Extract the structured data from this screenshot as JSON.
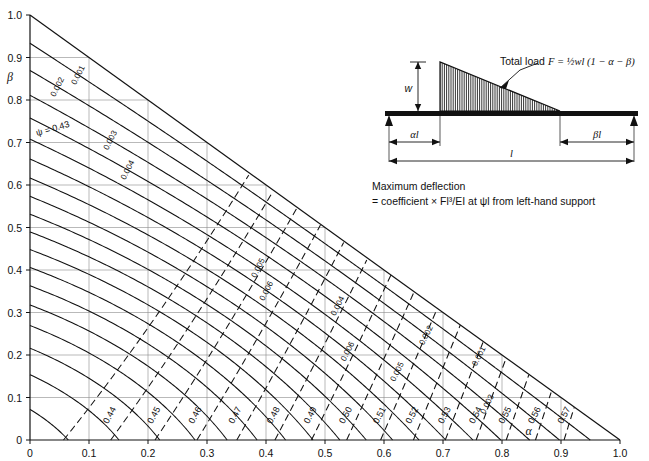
{
  "figure": {
    "axes": {
      "xlabel": "α",
      "ylabel": "β",
      "xticks": [
        "0",
        "0.1",
        "0.2",
        "0.3",
        "0.4",
        "0.5",
        "0.6",
        "0.7",
        "0.8",
        "0.9",
        "1.0"
      ],
      "yticks": [
        "0",
        "0.1",
        "0.2",
        "0.3",
        "0.4",
        "0.5",
        "0.6",
        "0.7",
        "0.8",
        "0.9",
        "1.0"
      ],
      "xlim": [
        0,
        1
      ],
      "ylim": [
        0,
        1
      ]
    },
    "diagram": {
      "total_load_label": "Total load",
      "total_load_formula": "F = ½wl (1 − α − β)",
      "load_height_label": "w",
      "left_span_label": "αl",
      "right_span_label": "βl",
      "total_span_label": "l"
    },
    "caption": {
      "line1": "Maximum deflection",
      "line2": "= coefficient × Fl³/EI at ψl from left-hand support"
    },
    "psi_first_label": "ψ = 0.43"
  },
  "chart_data": {
    "type": "contour",
    "title": "",
    "xlabel": "α",
    "ylabel": "β",
    "xlim": [
      0,
      1
    ],
    "ylim": [
      0,
      1
    ],
    "grid": true,
    "domain": "triangular region alpha + beta <= 1",
    "series": [
      {
        "name": "deflection coefficient",
        "style": "solid",
        "levels": [
          0.001,
          0.002,
          0.003,
          0.004,
          0.005,
          0.006,
          0.007,
          0.008,
          0.009,
          0.01,
          0.011,
          0.012,
          0.013,
          0.014,
          0.015,
          0.016,
          0.017,
          0.018,
          0.019,
          0.02,
          0.021
        ],
        "labels": [
          "0.001",
          "0.002",
          "0.003",
          "0.004",
          "0.005",
          "0.006",
          "0.007",
          "0.008",
          "0.009",
          "0.010",
          "0.011",
          "0.012",
          "0.013",
          "0.014",
          "0.015",
          "0.016",
          "0.017",
          "0.018",
          "0.019",
          "0.020",
          "0.021"
        ],
        "max_value": 0.021,
        "max_location": [
          0.35,
          0.25
        ],
        "note": "Contours are closed U-shaped curves nested about the interior maximum; value falls to 0.001 at the hypotenuse alpha+beta=1"
      },
      {
        "name": "ψ (position of maximum deflection)",
        "style": "dashed",
        "levels": [
          0.43,
          0.44,
          0.45,
          0.46,
          0.47,
          0.48,
          0.49,
          0.5,
          0.51,
          0.52,
          0.53,
          0.54,
          0.55,
          0.56,
          0.57
        ],
        "labels": [
          "0.43",
          "0.44",
          "0.45",
          "0.46",
          "0.47",
          "0.48",
          "0.49",
          "0.50",
          "0.51",
          "0.52",
          "0.53",
          "0.54",
          "0.55",
          "0.56",
          "0.57"
        ],
        "note": "Dashed contours sweep from upper-left to lower-right across the triangle"
      }
    ]
  },
  "colors": {
    "line": "#111111",
    "grid": "#8a8a8a",
    "background": "#ffffff"
  }
}
